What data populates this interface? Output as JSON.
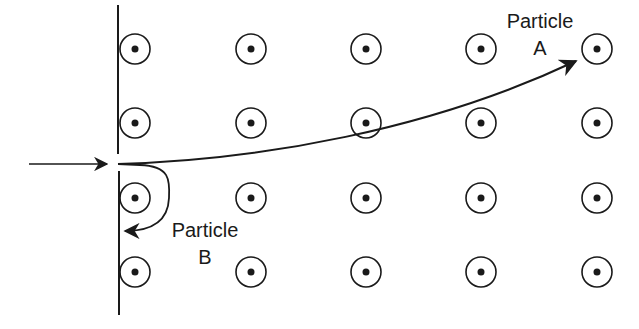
{
  "figure": {
    "type": "magnetic-field-particle-deflection",
    "field_symbol": "dot-in-circle (field out of page)",
    "field_grid": {
      "columns_x": [
        135,
        251,
        366,
        481,
        597
      ],
      "rows_y": [
        49,
        123,
        198,
        272
      ],
      "circle_radius": 15,
      "dot_radius": 3.5
    },
    "colors": {
      "ink": "#1a1a1a",
      "background": "#ffffff"
    }
  },
  "labels": {
    "particle_a": {
      "line1": "Particle",
      "line2": "A"
    },
    "particle_b": {
      "line1": "Particle",
      "line2": "B"
    }
  }
}
